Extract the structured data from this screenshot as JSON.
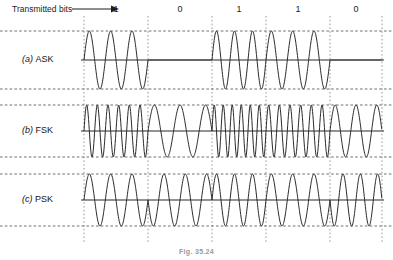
{
  "figure": {
    "caption": "Fig. 35.24",
    "transmitted_label": "Transmitted bits",
    "arrow_icon": "right-arrow-icon"
  },
  "bits": [
    {
      "value": "1",
      "index": 0
    },
    {
      "value": "0",
      "index": 1
    },
    {
      "value": "1",
      "index": 2
    },
    {
      "value": "1",
      "index": 3
    },
    {
      "value": "0",
      "index": 4
    }
  ],
  "rows": [
    {
      "id": "ask",
      "tag": "(a)",
      "label": "ASK",
      "full": "(a) ASK"
    },
    {
      "id": "fsk",
      "tag": "(b)",
      "label": "FSK",
      "full": "(b) FSK"
    },
    {
      "id": "psk",
      "tag": "(c)",
      "label": "PSK",
      "full": "(c) PSK"
    }
  ],
  "chart_data": {
    "type": "line",
    "title": "Fig. 35.24",
    "xlabel": "Transmitted bits",
    "ylabel": "",
    "grid": true,
    "legend": "none",
    "bit_sequence": [
      1,
      0,
      1,
      1,
      0
    ],
    "bit_boundaries_px": [
      84,
      148,
      212,
      266,
      330,
      382
    ],
    "plot_left_px": 84,
    "plot_right_px": 382,
    "amplitude": 1,
    "series": [
      {
        "name": "(a) ASK",
        "modulation": "amplitude-shift-keying",
        "carrier_cycles_per_bit": 3,
        "amplitude_for_one": 1,
        "amplitude_for_zero": 0,
        "baseline_px": 60,
        "top_px": 31,
        "bottom_px": 89,
        "values": [
          1,
          0,
          1,
          1,
          0
        ]
      },
      {
        "name": "(b) FSK",
        "modulation": "frequency-shift-keying",
        "cycles_per_bit_for_one": 6,
        "cycles_per_bit_for_zero": 2.5,
        "amplitude": 1,
        "baseline_px": 131,
        "top_px": 105,
        "bottom_px": 157,
        "values": [
          1,
          0,
          1,
          1,
          0
        ]
      },
      {
        "name": "(c) PSK",
        "modulation": "phase-shift-keying",
        "carrier_cycles_per_bit": 3,
        "phase_for_one_deg": 0,
        "phase_for_zero_deg": 180,
        "amplitude": 1,
        "baseline_px": 200,
        "top_px": 174,
        "bottom_px": 226,
        "values": [
          1,
          0,
          1,
          1,
          0
        ]
      }
    ],
    "ylim": [
      -1,
      1
    ],
    "xlim": [
      0,
      5
    ]
  }
}
